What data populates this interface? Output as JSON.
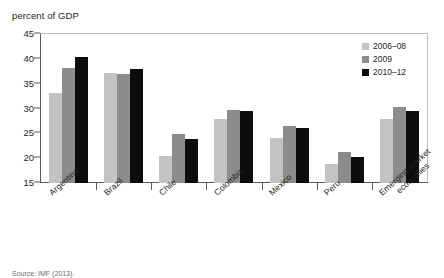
{
  "chart_data": {
    "type": "bar",
    "title": "",
    "ylabel": "percent of GDP",
    "xlabel": "",
    "ylim": [
      15,
      45
    ],
    "yticks": [
      45,
      40,
      35,
      30,
      25,
      20,
      15
    ],
    "grid": false,
    "legend_position": "top-right",
    "categories": [
      "Argentina",
      "Brazil",
      "Chile",
      "Colombia",
      "Mexico",
      "Peru",
      "Emerging-market economies"
    ],
    "series": [
      {
        "name": "2006–08",
        "color": "#c3c3c3",
        "values": [
          33.1,
          37.1,
          20.5,
          27.8,
          24.0,
          18.8,
          27.9
        ]
      },
      {
        "name": "2009",
        "color": "#8c8c8c",
        "values": [
          38.1,
          37.0,
          24.8,
          29.7,
          26.5,
          21.3,
          30.4
        ]
      },
      {
        "name": "2010–12",
        "color": "#0d0d0d",
        "values": [
          40.3,
          37.9,
          23.8,
          29.4,
          26.0,
          20.3,
          29.6
        ]
      }
    ]
  },
  "axis": {
    "y_title": "percent of GDP"
  },
  "category_labels": [
    {
      "line1": "Argentina",
      "line2": ""
    },
    {
      "line1": "Brazil",
      "line2": ""
    },
    {
      "line1": "Chile",
      "line2": ""
    },
    {
      "line1": "Colombia",
      "line2": ""
    },
    {
      "line1": "Mexico",
      "line2": ""
    },
    {
      "line1": "Peru",
      "line2": ""
    },
    {
      "line1": "Emerging-market",
      "line2": "economies"
    }
  ],
  "footer": {
    "source": "Source: IMF (2013)."
  }
}
